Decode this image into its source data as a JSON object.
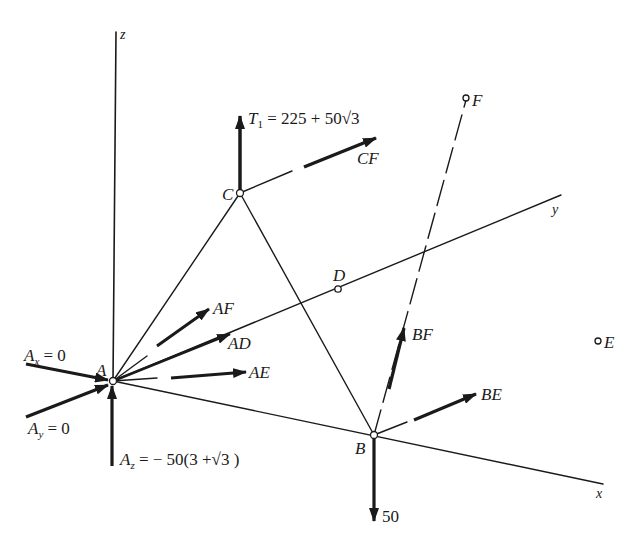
{
  "diagram": {
    "type": "3D free-body diagram of space truss",
    "axes": {
      "x": "x",
      "y": "y",
      "z": "z"
    },
    "points": {
      "A": "A",
      "B": "B",
      "C": "C",
      "D": "D",
      "E": "E",
      "F": "F"
    },
    "forces": {
      "T1": {
        "symbol": "T",
        "sub": "1",
        "expr": "= 225 + 50√3"
      },
      "CF": "CF",
      "AF": "AF",
      "AD": "AD",
      "AE": "AE",
      "BF": "BF",
      "BE": "BE",
      "B_load": "50",
      "Ax": {
        "symbol": "A",
        "sub": "x",
        "expr": "= 0"
      },
      "Ay": {
        "symbol": "A",
        "sub": "y",
        "expr": "= 0"
      },
      "Az": {
        "symbol": "A",
        "sub": "z",
        "expr": "= − 50(3 +√3 )"
      }
    },
    "colors": {
      "ink": "#1a1a1a",
      "background": "#ffffff"
    }
  }
}
